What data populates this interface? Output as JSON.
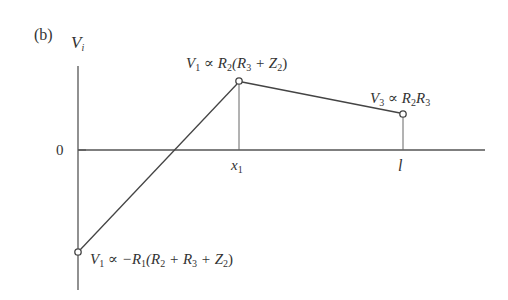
{
  "panel_label": "(b)",
  "axes": {
    "y_label": "V",
    "y_label_sub": "i",
    "zero_label": "0",
    "x_ticks": [
      {
        "label": "x",
        "sub": "1"
      },
      {
        "label": "l",
        "sub": ""
      }
    ]
  },
  "annotations": {
    "peak": {
      "v": "V",
      "vsub": "1",
      "rest_a": " ∝ R",
      "sub_a": "2",
      "rest_b": "(R",
      "sub_b": "3",
      "rest_c": " + Z",
      "sub_c": "2",
      "rest_d": ")"
    },
    "end": {
      "v": "V",
      "vsub": "3",
      "rest_a": " ∝ R",
      "sub_a": "2",
      "rest_b": "R",
      "sub_b": "3"
    },
    "start": {
      "v": "V",
      "vsub": "1",
      "rest_a": " ∝ −R",
      "sub_a": "1",
      "rest_b": "(R",
      "sub_b": "2",
      "rest_c": " + R",
      "sub_c": "3",
      "rest_d": " + Z",
      "sub_d": "2",
      "rest_e": ")"
    }
  },
  "colors": {
    "line": "#444444",
    "bg": "#ffffff"
  }
}
